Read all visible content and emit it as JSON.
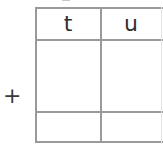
{
  "worksheet": {
    "operator_symbol": "+",
    "column_headers": [
      {
        "key": "t",
        "label": "t"
      },
      {
        "key": "u",
        "label": "u"
      }
    ],
    "addend_row": {
      "t": "",
      "u": ""
    },
    "answer_row": {
      "t": "",
      "u": ""
    }
  },
  "colors": {
    "grid_line": "#9a9a9a",
    "text": "#2f2f2f"
  }
}
